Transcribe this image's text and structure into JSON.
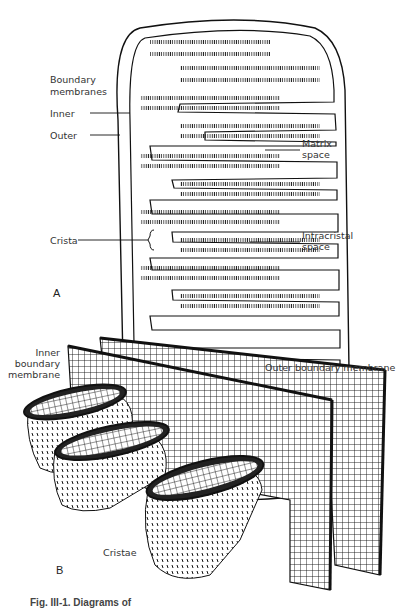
{
  "figure": {
    "panel_a": {
      "label": "A",
      "title_label": {
        "line1": "Boundary",
        "line2": "membranes"
      },
      "labels": {
        "inner": "Inner",
        "outer": "Outer",
        "crista": "Crista",
        "matrix": {
          "line1": "Matrix",
          "line2": "space"
        },
        "intracristal": {
          "line1": "Intracristal",
          "line2": "space"
        }
      }
    },
    "panel_b": {
      "label": "B",
      "labels": {
        "inner_boundary": {
          "line1": "Inner",
          "line2": "boundary",
          "line3": "membrane"
        },
        "outer_boundary": "Outer boundary membrane",
        "cristae": "Cristae"
      }
    },
    "caption": "Fig. III-1. Diagrams of"
  }
}
